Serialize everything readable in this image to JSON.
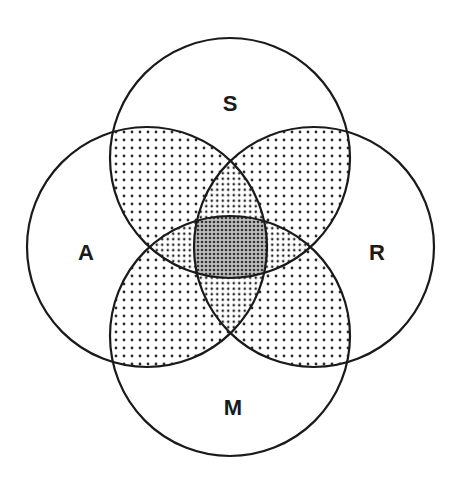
{
  "diagram": {
    "type": "venn",
    "sets": [
      {
        "id": "S",
        "label": "S",
        "cx": 230,
        "cy": 158,
        "r": 120,
        "label_x": 230,
        "label_y": 111
      },
      {
        "id": "A",
        "label": "A",
        "cx": 147,
        "cy": 247,
        "r": 120,
        "label_x": 86,
        "label_y": 260
      },
      {
        "id": "R",
        "label": "R",
        "cx": 314,
        "cy": 247,
        "r": 120,
        "label_x": 377,
        "label_y": 260
      },
      {
        "id": "M",
        "label": "M",
        "cx": 230,
        "cy": 336,
        "r": 120,
        "label_x": 233,
        "label_y": 415
      }
    ],
    "shading": {
      "exclusive_regions": "white",
      "pairwise_overlaps": "light dot pattern",
      "triple_overlaps": "medium dot pattern",
      "all_four_overlap": "dense dot pattern"
    },
    "colors": {
      "stroke": "#1a1a1a",
      "background": "#ffffff",
      "dot": "#2a2a2a"
    }
  }
}
